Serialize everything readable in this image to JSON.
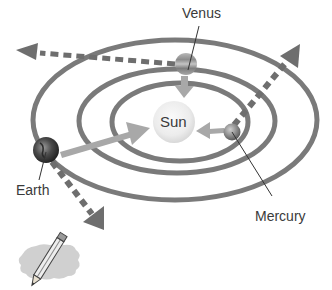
{
  "diagram": {
    "type": "solar-system-orbits",
    "sun": {
      "label": "Sun"
    },
    "planets": [
      {
        "name": "Venus",
        "label": "Venus"
      },
      {
        "name": "Earth",
        "label": "Earth"
      },
      {
        "name": "Mercury",
        "label": "Mercury"
      }
    ],
    "orbits": [
      "inner",
      "middle",
      "outer"
    ],
    "arrows": [
      {
        "from": "Venus",
        "direction": "toward-sun",
        "style": "solid"
      },
      {
        "from": "Earth",
        "direction": "toward-sun",
        "style": "solid"
      },
      {
        "from": "Mercury",
        "direction": "toward-sun",
        "style": "solid"
      },
      {
        "from": "Venus",
        "direction": "tangent-left",
        "style": "dashed"
      },
      {
        "from": "Earth",
        "direction": "tangent-down",
        "style": "dashed"
      },
      {
        "from": "Mercury",
        "direction": "tangent-up-right",
        "style": "dashed"
      }
    ],
    "icon": "pencil-on-note-icon",
    "colors": {
      "orbit": "#7a7a7a",
      "dashed_arrow": "#6e6e6e",
      "solid_arrow": "#a8a8a8",
      "sun_fill": "#eeeeee",
      "label_text": "#3a3a3a",
      "note_fill": "#d0d0d0"
    }
  }
}
